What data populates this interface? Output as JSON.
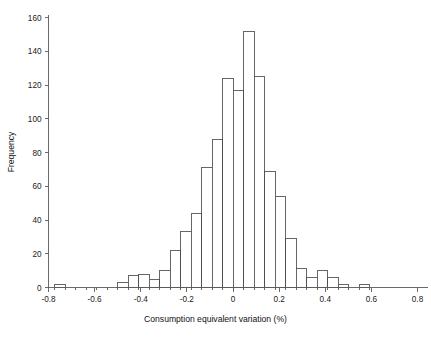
{
  "chart_data": {
    "type": "bar",
    "subtype": "histogram",
    "title": "",
    "xlabel": "Consumption equivalent variation (%)",
    "ylabel": "Frequency",
    "xlim": [
      -0.8,
      0.8
    ],
    "ylim": [
      0,
      160
    ],
    "xticks": [
      "-0.8",
      "-0.6",
      "-0.4",
      "-0.2",
      "0",
      "0.2",
      "0.4",
      "0.6",
      "0.8"
    ],
    "xtick_values": [
      -0.8,
      -0.6,
      -0.4,
      -0.2,
      0,
      0.2,
      0.4,
      0.6,
      0.8
    ],
    "yticks": [
      "0",
      "20",
      "40",
      "60",
      "80",
      "100",
      "120",
      "140",
      "160"
    ],
    "ytick_values": [
      0,
      20,
      40,
      60,
      80,
      100,
      120,
      140,
      160
    ],
    "grid": false,
    "legend": false,
    "bin_width": 0.0455,
    "bin_left_edges": [
      -0.773,
      -0.7275,
      -0.682,
      -0.6365,
      -0.591,
      -0.5455,
      -0.5,
      -0.4545,
      -0.409,
      -0.3635,
      -0.318,
      -0.2725,
      -0.227,
      -0.1815,
      -0.136,
      -0.0905,
      -0.045,
      0.0005,
      0.046,
      0.0915,
      0.137,
      0.1825,
      0.228,
      0.2735,
      0.319,
      0.3645,
      0.41,
      0.4555,
      0.501,
      0.5465,
      0.592
    ],
    "values": [
      2,
      0,
      0,
      0,
      0,
      0,
      3,
      7,
      8,
      5,
      10,
      22,
      33,
      44,
      71,
      88,
      124,
      117,
      152,
      125,
      69,
      54,
      29,
      11,
      6,
      10,
      6,
      2,
      0,
      2,
      0
    ],
    "series": [
      {
        "name": "Frequency",
        "values": [
          2,
          0,
          0,
          0,
          0,
          0,
          3,
          7,
          8,
          5,
          10,
          22,
          33,
          44,
          71,
          88,
          124,
          117,
          152,
          125,
          69,
          54,
          29,
          11,
          6,
          10,
          6,
          2,
          0,
          2,
          0
        ]
      }
    ],
    "bars": [
      {
        "x": -0.773,
        "value": 2
      },
      {
        "x": -0.5,
        "value": 3
      },
      {
        "x": -0.4545,
        "value": 7
      },
      {
        "x": -0.409,
        "value": 8
      },
      {
        "x": -0.3635,
        "value": 5
      },
      {
        "x": -0.318,
        "value": 10
      },
      {
        "x": -0.2725,
        "value": 22
      },
      {
        "x": -0.227,
        "value": 33
      },
      {
        "x": -0.1815,
        "value": 44
      },
      {
        "x": -0.136,
        "value": 71
      },
      {
        "x": -0.0905,
        "value": 88
      },
      {
        "x": -0.045,
        "value": 124
      },
      {
        "x": 0.0005,
        "value": 117
      },
      {
        "x": 0.046,
        "value": 152
      },
      {
        "x": 0.0915,
        "value": 125
      },
      {
        "x": 0.137,
        "value": 69
      },
      {
        "x": 0.1825,
        "value": 54
      },
      {
        "x": 0.228,
        "value": 29
      },
      {
        "x": 0.2735,
        "value": 11
      },
      {
        "x": 0.319,
        "value": 6
      },
      {
        "x": 0.3645,
        "value": 10
      },
      {
        "x": 0.41,
        "value": 6
      },
      {
        "x": 0.4555,
        "value": 2
      },
      {
        "x": 0.5465,
        "value": 2
      }
    ]
  },
  "colors": {
    "background": "#ffffff",
    "bar_fill": "#ffffff",
    "bar_stroke": "#4b4b4b",
    "axis": "#5a5a5a",
    "text": "#1a1a1a"
  }
}
